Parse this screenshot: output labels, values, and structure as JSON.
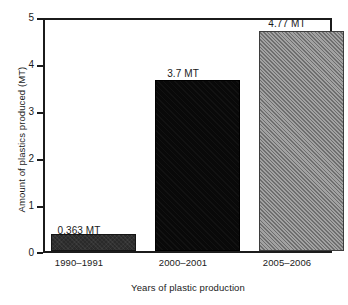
{
  "chart_data": {
    "type": "bar",
    "title": "",
    "xlabel": "Years of plastic production",
    "ylabel": "Amount of plastics produced (MT)",
    "categories": [
      "1990–1991",
      "2000–2001",
      "2005–2006"
    ],
    "values": [
      0.363,
      3.7,
      4.77
    ],
    "value_labels": [
      "0.363 MT",
      "3.7 MT",
      "4.77 MT"
    ],
    "series": [
      {
        "name": "Amount of plastics produced (MT)",
        "values": [
          0.363,
          3.7,
          4.77
        ]
      }
    ],
    "ylim": [
      0,
      5
    ],
    "yticks": [
      "0",
      "1",
      "2",
      "3",
      "4",
      "5"
    ],
    "grid": false,
    "legend": false,
    "unit": "MT",
    "bar_styles": [
      "solid-dark",
      "solid-black",
      "hatch-gray"
    ],
    "colors": {
      "bar1": "#2a2a2a",
      "bar2": "#090909",
      "bar3": "#8c8c8c",
      "axis": "#1b1b1b",
      "text": "#1a1a1a",
      "background": "#ffffff"
    }
  }
}
